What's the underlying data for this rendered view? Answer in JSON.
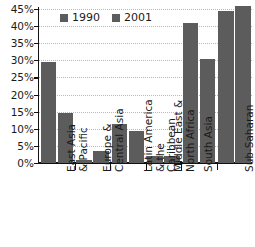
{
  "chart_data": {
    "type": "bar",
    "title": "",
    "xlabel": "",
    "ylabel": "",
    "ylim": [
      0,
      45
    ],
    "ytick_labels": [
      "45%",
      "40%",
      "35%",
      "30%",
      "25%",
      "20%",
      "15%",
      "10%",
      "5%",
      "0%"
    ],
    "ytick_values": [
      45,
      40,
      35,
      30,
      25,
      20,
      15,
      10,
      5,
      0
    ],
    "grid": true,
    "legend_position": "top-center",
    "categories": [
      "East Asia\n& Pacific",
      "Europe &\nCentral Asia",
      "Latin America\n& the\nCaribbean",
      "Middle East &\nNorth Africa",
      "South Asia",
      "Sub-Saharan\nAfrica"
    ],
    "series": [
      {
        "name": "1990",
        "color": "#5c5c5c",
        "values": [
          29.5,
          1.0,
          11.5,
          2.0,
          41.0,
          44.5
        ]
      },
      {
        "name": "2001",
        "color": "#5c5c5c",
        "values": [
          14.5,
          3.5,
          9.5,
          2.0,
          30.5,
          46.0
        ]
      }
    ]
  },
  "legend": {
    "items": [
      {
        "label": "1990"
      },
      {
        "label": "2001"
      }
    ]
  }
}
